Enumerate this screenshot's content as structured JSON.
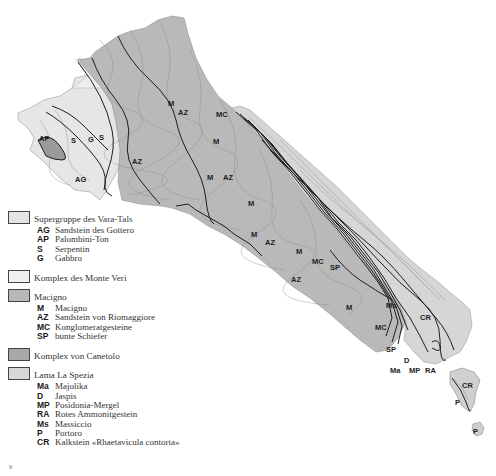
{
  "colors": {
    "vara_tals": "#e8e8e8",
    "monte_veri": "#f0f0f0",
    "macigno": "#b8b8b8",
    "canetolo": "#a8a8a8",
    "la_spezia": "#d4d4d4",
    "contour": "#8a8a8a",
    "boundary": "#1e1e1e"
  },
  "legend": {
    "groups": [
      {
        "label": "Supergruppe des Vara-Tals",
        "swatch": "#e4e4e4",
        "items": [
          {
            "code": "AG",
            "desc": "Sandstein des Gottero"
          },
          {
            "code": "AP",
            "desc": "Palombini-Ton"
          },
          {
            "code": "S",
            "desc": "Serpentin"
          },
          {
            "code": "G",
            "desc": "Gabbro"
          }
        ]
      },
      {
        "label": "Komplex des Monte Veri",
        "swatch": "#f0f0f0",
        "items": []
      },
      {
        "label": "Macigno",
        "swatch": "#b8b8b8",
        "items": [
          {
            "code": "M",
            "desc": "Macigno"
          },
          {
            "code": "AZ",
            "desc": "Sandstein von Riomaggiore"
          },
          {
            "code": "MC",
            "desc": "Konglomeratgesteine"
          },
          {
            "code": "SP",
            "desc": "bunte Schiefer"
          }
        ]
      },
      {
        "label": "Komplex von Canetolo",
        "swatch": "#a8a8a8",
        "items": []
      },
      {
        "label": "Lama La Spezia",
        "swatch": "#d8d8d8",
        "items": [
          {
            "code": "Ma",
            "desc": "Majolika"
          },
          {
            "code": "D",
            "desc": "Jaspis"
          },
          {
            "code": "MP",
            "desc": "Posidonia-Mergel"
          },
          {
            "code": "RA",
            "desc": "Rotes Ammonitgestein"
          },
          {
            "code": "Ms",
            "desc": "Massiccio"
          },
          {
            "code": "P",
            "desc": "Portoro"
          },
          {
            "code": "CR",
            "desc": "Kalkstein «Rhaetavicula contorta»"
          }
        ]
      }
    ]
  },
  "map_labels": [
    {
      "text": "AG",
      "x": 75,
      "y": 182
    },
    {
      "text": "AP",
      "x": 39,
      "y": 141
    },
    {
      "text": "S",
      "x": 71,
      "y": 143
    },
    {
      "text": "G",
      "x": 88,
      "y": 142
    },
    {
      "text": "S",
      "x": 99,
      "y": 140
    },
    {
      "text": "AZ",
      "x": 132,
      "y": 164
    },
    {
      "text": "M",
      "x": 168,
      "y": 106
    },
    {
      "text": "AZ",
      "x": 178,
      "y": 115
    },
    {
      "text": "MC",
      "x": 216,
      "y": 117
    },
    {
      "text": "M",
      "x": 213,
      "y": 144
    },
    {
      "text": "M",
      "x": 207,
      "y": 180
    },
    {
      "text": "AZ",
      "x": 223,
      "y": 180
    },
    {
      "text": "M",
      "x": 248,
      "y": 206
    },
    {
      "text": "M",
      "x": 251,
      "y": 237
    },
    {
      "text": "AZ",
      "x": 265,
      "y": 245
    },
    {
      "text": "M",
      "x": 296,
      "y": 254
    },
    {
      "text": "MC",
      "x": 312,
      "y": 264
    },
    {
      "text": "SP",
      "x": 330,
      "y": 270
    },
    {
      "text": "AZ",
      "x": 291,
      "y": 282
    },
    {
      "text": "M",
      "x": 346,
      "y": 310
    },
    {
      "text": "Ms",
      "x": 386,
      "y": 308
    },
    {
      "text": "CR",
      "x": 420,
      "y": 320
    },
    {
      "text": "MC",
      "x": 375,
      "y": 330
    },
    {
      "text": "SP",
      "x": 386,
      "y": 352
    },
    {
      "text": "D",
      "x": 404,
      "y": 363
    },
    {
      "text": "Ma",
      "x": 390,
      "y": 373
    },
    {
      "text": "MP",
      "x": 409,
      "y": 373
    },
    {
      "text": "RA",
      "x": 425,
      "y": 373
    },
    {
      "text": "CR",
      "x": 462,
      "y": 388
    },
    {
      "text": "P",
      "x": 455,
      "y": 405
    },
    {
      "text": "P",
      "x": 473,
      "y": 434
    }
  ],
  "page_number": "9"
}
